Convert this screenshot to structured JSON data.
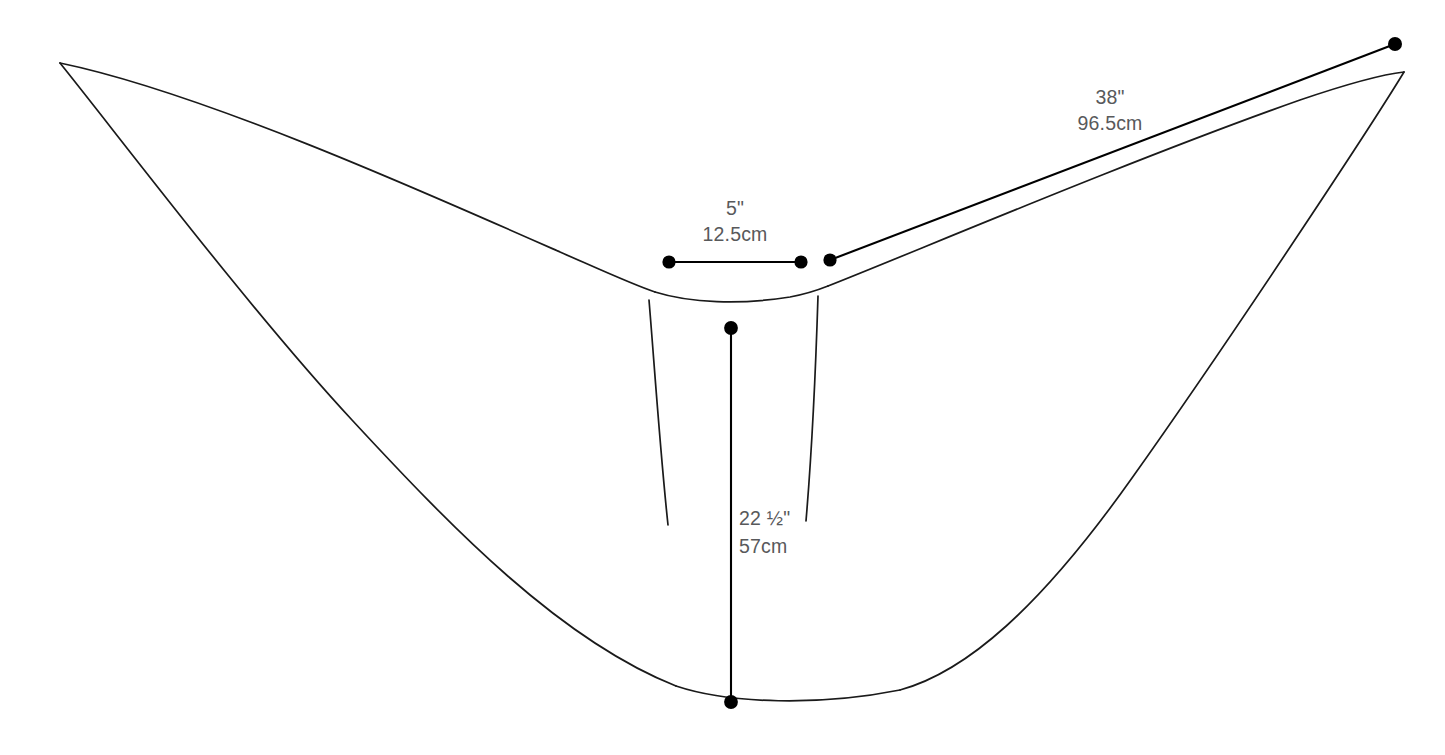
{
  "diagram": {
    "type": "technical-line-drawing",
    "background_color": "#ffffff",
    "outline_color": "#1a1a1a",
    "label_color": "#58595b",
    "marker_color": "#000000",
    "measurements": [
      {
        "id": "neckline-width",
        "imperial": "5\"",
        "metric": "12.5cm",
        "orientation": "horizontal",
        "from": [
          669,
          262
        ],
        "to": [
          801,
          262
        ],
        "label_x": 735,
        "label_imperial_y": 215,
        "label_metric_y": 241
      },
      {
        "id": "shoulder-to-tip",
        "imperial": "38\"",
        "metric": "96.5cm",
        "orientation": "diagonal",
        "from": [
          830,
          260
        ],
        "to": [
          1395,
          44
        ],
        "label_x": 1110,
        "label_imperial_y": 104,
        "label_metric_y": 130
      },
      {
        "id": "center-back-length",
        "imperial": "22 ½\"",
        "metric": "57cm",
        "orientation": "vertical",
        "from": [
          731,
          328
        ],
        "to": [
          731,
          702
        ],
        "label_x": 739,
        "label_imperial_y": 525,
        "label_metric_y": 553
      }
    ],
    "markers": [
      {
        "id": "neckline-left-dot",
        "cx": 669,
        "cy": 262,
        "r": 6.6
      },
      {
        "id": "neckline-right-dot",
        "cx": 801,
        "cy": 262,
        "r": 6.6
      },
      {
        "id": "shoulder-dot",
        "cx": 830,
        "cy": 260,
        "r": 6.6
      },
      {
        "id": "right-tip-dot",
        "cx": 1395,
        "cy": 44,
        "r": 7.0
      },
      {
        "id": "center-top-dot",
        "cx": 731,
        "cy": 328,
        "r": 6.9
      },
      {
        "id": "center-bottom-dot",
        "cx": 731,
        "cy": 702,
        "r": 6.9
      }
    ],
    "paths": {
      "upper_edge_left": "M 60,63 C 200,92 420,190 560,252 C 610,274 636,286 655,292",
      "outer_edge_left": "M 60,63 C 118,135 250,310 352,420 C 452,528 560,640 676,686",
      "neckline": "M 655,292 C 690,303 740,305 790,297 C 806,294 818,290 828,286",
      "upper_edge_right": "M 828,286 C 900,258 1130,160 1300,100 C 1350,83 1386,74 1404,72",
      "outer_edge_right": "M 1404,72 C 1370,128 1230,340 1132,478 C 1040,608 966,672 900,690",
      "bottom_edge": "M 676,686 C 730,704 820,706 900,690",
      "dart_left": "M 649,300 C 654,360 660,450 668,525",
      "dart_right": "M 818,296 C 816,360 812,450 806,521"
    }
  }
}
